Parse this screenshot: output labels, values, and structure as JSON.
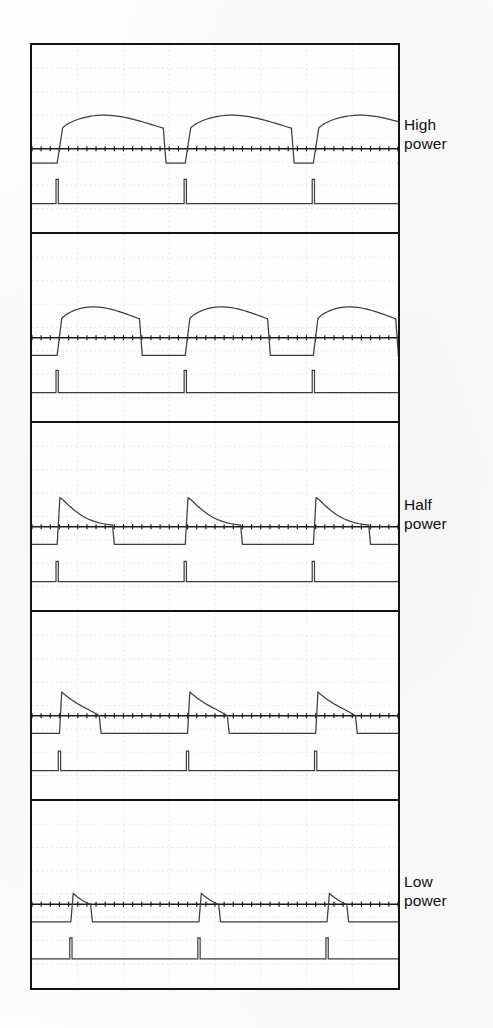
{
  "figure": {
    "kind": "oscilloscope-trace-stack",
    "panel_count": 5,
    "background_color": "#fdfdfc",
    "trace_color": "#3d3d3d",
    "axis_color": "#1a1a1a",
    "grid_color": "#c9c9cf",
    "frame_color": "#141414"
  },
  "labels": {
    "high_power_line1": "High",
    "high_power_line2": "power",
    "half_power_line1": "Half",
    "half_power_line2": "power",
    "low_power_line1": "Low",
    "low_power_line2": "power"
  },
  "chart_data": {
    "type": "line",
    "title": "",
    "xlabel": "",
    "ylabel": "",
    "grid": true,
    "legend_position": "right",
    "axis_ticks_per_division": 5,
    "grid_divisions_x": 8,
    "grid_divisions_y": 8,
    "annotations": [
      "High power",
      "Half power",
      "Low power"
    ],
    "panels": [
      {
        "index": 0,
        "label": "High power",
        "pulse_count": 3,
        "pulse_shape": "rounded-dome",
        "pulse_peak_amplitude": 1.0,
        "pulse_width_div": 2.2,
        "rise_time_div": 0.12,
        "fall_time_div": 1.6,
        "baseline_level": -0.42,
        "pulse_starts_div": [
          0.55,
          3.35,
          6.15
        ],
        "period_div": 2.8,
        "spike_trace": {
          "baseline": -1.62,
          "spike_height": 0.72,
          "spike_width_div": 0.05,
          "spike_positions_div": [
            0.55,
            3.35,
            6.15
          ]
        }
      },
      {
        "index": 1,
        "label": "",
        "pulse_count": 3,
        "pulse_shape": "rounded-dome-narrow",
        "pulse_peak_amplitude": 0.92,
        "pulse_width_div": 1.7,
        "rise_time_div": 0.1,
        "fall_time_div": 1.2,
        "baseline_level": -0.52,
        "pulse_starts_div": [
          0.55,
          3.35,
          6.15
        ],
        "period_div": 2.8,
        "spike_trace": {
          "baseline": -1.62,
          "spike_height": 0.66,
          "spike_width_div": 0.05,
          "spike_positions_div": [
            0.55,
            3.35,
            6.15
          ]
        }
      },
      {
        "index": 2,
        "label": "Half power",
        "pulse_count": 3,
        "pulse_shape": "sharp-rise-exponential-decay",
        "pulse_peak_amplitude": 0.86,
        "pulse_width_div": 1.4,
        "rise_time_div": 0.06,
        "fall_time_div": 1.15,
        "baseline_level": -0.52,
        "pulse_starts_div": [
          0.55,
          3.35,
          6.15
        ],
        "period_div": 2.8,
        "spike_trace": {
          "baseline": -1.62,
          "spike_height": 0.6,
          "spike_width_div": 0.05,
          "spike_positions_div": [
            0.55,
            3.35,
            6.15
          ]
        }
      },
      {
        "index": 3,
        "label": "",
        "pulse_count": 3,
        "pulse_shape": "triangular-sawtooth",
        "pulse_peak_amplitude": 0.7,
        "pulse_width_div": 1.0,
        "rise_time_div": 0.05,
        "fall_time_div": 0.82,
        "baseline_level": -0.52,
        "pulse_starts_div": [
          0.6,
          3.4,
          6.2
        ],
        "period_div": 2.8,
        "spike_trace": {
          "baseline": -1.62,
          "spike_height": 0.58,
          "spike_width_div": 0.05,
          "spike_positions_div": [
            0.6,
            3.4,
            6.2
          ]
        }
      },
      {
        "index": 4,
        "label": "Low power",
        "pulse_count": 3,
        "pulse_shape": "narrow-triangular-spike",
        "pulse_peak_amplitude": 0.32,
        "pulse_width_div": 0.45,
        "rise_time_div": 0.05,
        "fall_time_div": 0.38,
        "baseline_level": -0.52,
        "pulse_starts_div": [
          0.85,
          3.65,
          6.45
        ],
        "period_div": 2.8,
        "spike_trace": {
          "baseline": -1.62,
          "spike_height": 0.62,
          "spike_width_div": 0.05,
          "spike_positions_div": [
            0.85,
            3.65,
            6.45
          ]
        }
      }
    ]
  }
}
